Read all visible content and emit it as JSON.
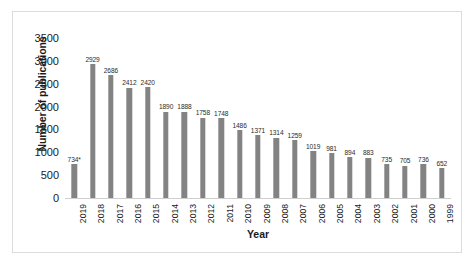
{
  "chart_data": {
    "type": "bar",
    "title": "",
    "xlabel": "Year",
    "ylabel": "Number of publications",
    "categories": [
      "2019",
      "2018",
      "2017",
      "2016",
      "2015",
      "2014",
      "2013",
      "2012",
      "2011",
      "2010",
      "2009",
      "2008",
      "2007",
      "2006",
      "2005",
      "2004",
      "2003",
      "2002",
      "2001",
      "2000",
      "1999"
    ],
    "values": [
      734,
      2929,
      2686,
      2412,
      2420,
      1890,
      1888,
      1758,
      1748,
      1486,
      1371,
      1314,
      1259,
      1019,
      981,
      894,
      883,
      735,
      705,
      736,
      652
    ],
    "data_labels": [
      "734*",
      "2929",
      "2686",
      "2412",
      "2420",
      "1890",
      "1888",
      "1758",
      "1748",
      "1486",
      "1371",
      "1314",
      "1259",
      "1019",
      "981",
      "894",
      "883",
      "735",
      "705",
      "736",
      "652"
    ],
    "ylim": [
      0,
      3500
    ],
    "yticks": [
      3500,
      3000,
      2500,
      2000,
      1500,
      1000,
      500,
      0
    ],
    "ytick_labels": [
      "3500",
      "3000",
      "2500",
      "2000",
      "1500",
      "1000",
      "500",
      "0"
    ],
    "grid": false,
    "legend": null,
    "bar_color": "#838383",
    "axis_color": "#cfcfcf",
    "border_color": "#dcdcdc",
    "text_color": "#1a1a1a",
    "footnote_marker": "*"
  }
}
